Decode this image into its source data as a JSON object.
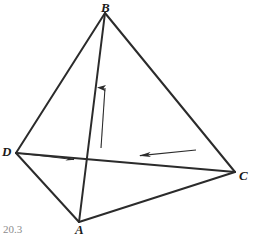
{
  "figure": {
    "kind": "tetrahedron-vector-diagram",
    "width": 253,
    "height": 234,
    "background_color": "#ffffff",
    "stroke_color": "#2b2b2b",
    "caption": "20.3",
    "vertices": [
      {
        "name": "B",
        "label": "B",
        "x": 105,
        "y": 13,
        "label_x": 101,
        "label_y": 2
      },
      {
        "name": "D",
        "label": "D",
        "x": 16,
        "y": 153,
        "label_x": 2,
        "label_y": 146
      },
      {
        "name": "C",
        "label": "C",
        "x": 235,
        "y": 172,
        "label_x": 239,
        "label_y": 170
      },
      {
        "name": "A",
        "label": "A",
        "x": 79,
        "y": 222,
        "label_x": 75,
        "label_y": 222
      }
    ],
    "edges": [
      {
        "name": "edge-B-D",
        "from": "B",
        "to": "D",
        "style": "solid",
        "width": 2.0
      },
      {
        "name": "edge-B-C",
        "from": "B",
        "to": "C",
        "style": "solid",
        "width": 2.0
      },
      {
        "name": "edge-B-A",
        "from": "B",
        "to": "A",
        "style": "solid",
        "width": 2.0
      },
      {
        "name": "edge-D-A",
        "from": "D",
        "to": "A",
        "style": "solid",
        "width": 2.0
      },
      {
        "name": "edge-A-C",
        "from": "A",
        "to": "C",
        "style": "solid",
        "width": 2.0
      },
      {
        "name": "edge-D-C",
        "from": "D",
        "to": "C",
        "style": "solid",
        "width": 2.0
      }
    ],
    "arrows": [
      {
        "name": "vertical-up-arrow",
        "direction": "up",
        "x1": 101,
        "y1": 148,
        "x2": 105,
        "y2": 86,
        "width": 1.1
      },
      {
        "name": "horizontal-left-arrow",
        "direction": "left",
        "x1": 196,
        "y1": 150,
        "x2": 137,
        "y2": 156,
        "width": 1.1
      },
      {
        "name": "short-right-arrow-from-D",
        "direction": "right",
        "x1": 18,
        "y1": 153,
        "x2": 74,
        "y2": 160,
        "width": 1.0
      }
    ]
  }
}
